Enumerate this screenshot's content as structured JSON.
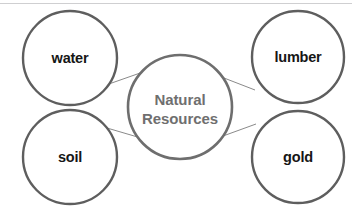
{
  "diagram": {
    "type": "concept-map",
    "canvas": {
      "width": 352,
      "height": 211,
      "background": "#ffffff"
    },
    "colors": {
      "circle_stroke": "#5e5e5e",
      "center_stroke": "#6e6e6e",
      "connector": "#8a8a8a",
      "satellite_text": "#161616",
      "center_text": "#6f6f6f",
      "top_rule": "#cfcfd1"
    },
    "center": {
      "label_line1": "Natural",
      "label_line2": "Resources",
      "cx": 180,
      "cy": 107,
      "r": 52
    },
    "satellites": [
      {
        "id": "water",
        "label": "water",
        "cx": 70,
        "cy": 58,
        "r": 47
      },
      {
        "id": "lumber",
        "label": "lumber",
        "cx": 298,
        "cy": 57,
        "r": 46
      },
      {
        "id": "soil",
        "label": "soil",
        "cx": 70,
        "cy": 157,
        "r": 47
      },
      {
        "id": "gold",
        "label": "gold",
        "cx": 298,
        "cy": 157,
        "r": 46
      }
    ],
    "connectors": [
      {
        "id": "center-to-water",
        "x1": 143,
        "y1": 72,
        "x2": 106,
        "y2": 85
      },
      {
        "id": "center-to-lumber",
        "x1": 224,
        "y1": 78,
        "x2": 255,
        "y2": 90
      },
      {
        "id": "center-to-soil",
        "x1": 141,
        "y1": 138,
        "x2": 107,
        "y2": 128
      },
      {
        "id": "center-to-gold",
        "x1": 223,
        "y1": 136,
        "x2": 256,
        "y2": 124
      }
    ]
  }
}
